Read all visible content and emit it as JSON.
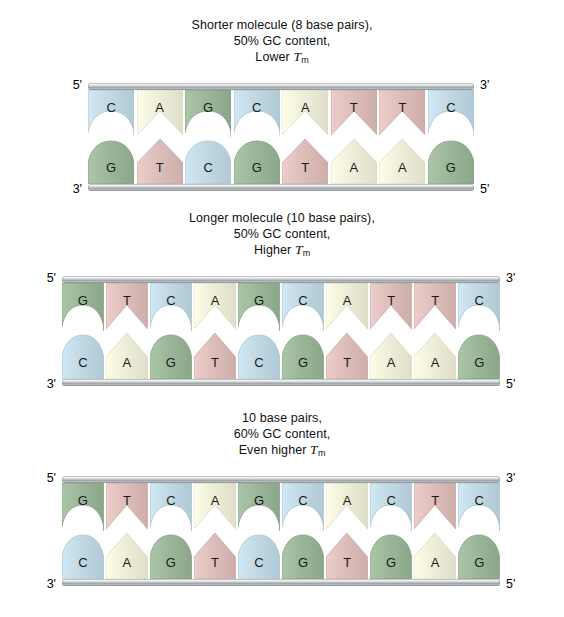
{
  "diagram": {
    "base_colors": {
      "A": "#f1f1db",
      "T": "#dfc0bc",
      "G": "#9eb89b",
      "C": "#c3dbe6"
    },
    "rail_color": "#b9bec0",
    "background": "#ffffff"
  },
  "panels": [
    {
      "id": "panel-1",
      "caption": {
        "line1": "Shorter molecule (8 base pairs),",
        "line2": "50% GC content,",
        "line3_prefix": "Lower ",
        "line3_symbol": "T",
        "line3_subscript": "m"
      },
      "labels": {
        "top_left": "5'",
        "top_right": "3'",
        "bottom_left": "3'",
        "bottom_right": "5'"
      },
      "base_pairs": 8,
      "gc_content": "50%",
      "top_strand": [
        "C",
        "A",
        "G",
        "C",
        "A",
        "T",
        "T",
        "C"
      ],
      "bottom_strand": [
        "G",
        "T",
        "C",
        "G",
        "T",
        "A",
        "A",
        "G"
      ]
    },
    {
      "id": "panel-2",
      "caption": {
        "line1": "Longer molecule (10 base pairs),",
        "line2": "50% GC content,",
        "line3_prefix": "Higher ",
        "line3_symbol": "T",
        "line3_subscript": "m"
      },
      "labels": {
        "top_left": "5'",
        "top_right": "3'",
        "bottom_left": "3'",
        "bottom_right": "5'"
      },
      "base_pairs": 10,
      "gc_content": "50%",
      "top_strand": [
        "G",
        "T",
        "C",
        "A",
        "G",
        "C",
        "A",
        "T",
        "T",
        "C"
      ],
      "bottom_strand": [
        "C",
        "A",
        "G",
        "T",
        "C",
        "G",
        "T",
        "A",
        "A",
        "G"
      ]
    },
    {
      "id": "panel-3",
      "caption": {
        "line1": "10 base pairs,",
        "line2": "60% GC content,",
        "line3_prefix": "Even higher ",
        "line3_symbol": "T",
        "line3_subscript": "m"
      },
      "labels": {
        "top_left": "5'",
        "top_right": "3'",
        "bottom_left": "3'",
        "bottom_right": "5'"
      },
      "base_pairs": 10,
      "gc_content": "60%",
      "top_strand": [
        "G",
        "T",
        "C",
        "A",
        "G",
        "C",
        "A",
        "C",
        "T",
        "C"
      ],
      "bottom_strand": [
        "C",
        "A",
        "G",
        "T",
        "C",
        "G",
        "T",
        "G",
        "A",
        "G"
      ]
    }
  ]
}
